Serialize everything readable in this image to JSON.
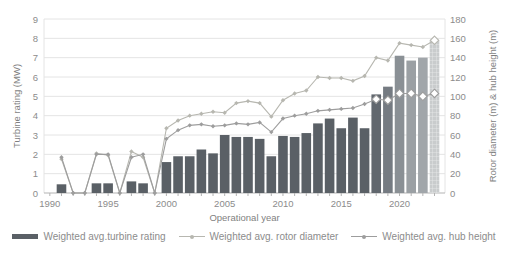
{
  "chart_data": {
    "type": "bar",
    "title": "",
    "xlabel": "Operational year",
    "ylabel_left": "Turbine rating (MW)",
    "ylabel_right": "Rotor diameter (m) & hub height (m)",
    "xlim": [
      1989.5,
      2023.9
    ],
    "ylim_left": [
      0,
      9
    ],
    "ylim_right": [
      0,
      180
    ],
    "x_tick_labels": [
      1990,
      1995,
      2000,
      2005,
      2010,
      2015,
      2020
    ],
    "y_ticks_left": [
      0,
      1,
      2,
      3,
      4,
      5,
      6,
      7,
      8,
      9
    ],
    "y_ticks_right": [
      0,
      20,
      40,
      60,
      80,
      100,
      120,
      140,
      160,
      180
    ],
    "grid": "horizontal",
    "legend_position": "bottom",
    "years": [
      1991,
      1992,
      1993,
      1994,
      1995,
      1996,
      1997,
      1998,
      1999,
      2000,
      2001,
      2002,
      2003,
      2004,
      2005,
      2006,
      2007,
      2008,
      2009,
      2010,
      2011,
      2012,
      2013,
      2014,
      2015,
      2016,
      2017,
      2018,
      2019,
      2020,
      2021,
      2022,
      2023
    ],
    "series": [
      {
        "name": "Weighted avg.turbine rating",
        "type": "bar",
        "axis": "left",
        "unit": "MW",
        "values": [
          0.45,
          0,
          0,
          0.5,
          0.5,
          0,
          0.6,
          0.5,
          0,
          1.6,
          1.9,
          1.9,
          2.25,
          2.05,
          3.0,
          2.9,
          2.9,
          2.8,
          1.9,
          2.95,
          2.9,
          3.1,
          3.6,
          3.85,
          3.35,
          3.9,
          3.35,
          5.1,
          5.5,
          7.1,
          6.85,
          7.0,
          7.9
        ]
      },
      {
        "name": "Weighted avg. rotor diameter",
        "type": "line",
        "axis": "right",
        "unit": "m",
        "values": [
          35,
          0,
          0,
          41,
          39,
          0,
          43,
          37,
          0,
          67,
          75,
          80,
          82,
          84,
          83,
          93,
          95,
          93,
          79,
          96,
          103,
          106,
          120,
          119,
          119,
          116,
          121,
          140,
          137,
          155,
          153,
          151,
          158
        ]
      },
      {
        "name": "Weighted avg. hub height",
        "type": "line",
        "axis": "right",
        "unit": "m",
        "values": [
          37,
          0,
          0,
          40,
          40,
          0,
          37,
          40,
          0,
          56,
          65,
          70,
          71,
          69,
          70,
          72,
          71,
          73,
          63,
          77,
          80,
          82,
          85,
          86,
          87,
          88,
          92,
          97,
          96,
          103,
          103,
          100,
          103
        ]
      }
    ],
    "bar_color": "#5a6066",
    "bar_colors_by_year": {
      "2018": "#61676e",
      "2019": "#757b82",
      "2020": "#8a9095",
      "2021": "#9ba0a4",
      "2022": "#a1a6aa",
      "2023": "#c9cccd"
    },
    "hatched_years": [
      2023
    ],
    "rotor_color": "#b7b7b0",
    "hub_color": "#9d9d9d",
    "open_marker_years_hub": [
      2018,
      2019,
      2020,
      2021,
      2022,
      2023
    ],
    "open_marker_years_rotor": [
      2023
    ],
    "grid_color": "#e4e4e4",
    "axis_color": "#b3b3b3",
    "tick_text_color": "#8c8c8c"
  }
}
